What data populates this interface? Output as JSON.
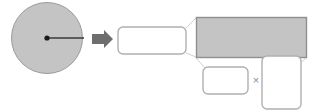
{
  "diagram": {
    "colors": {
      "shape_fill": "#c4c4c4",
      "shape_stroke": "#9a9a9a",
      "box_stroke": "#b0b0b0",
      "box_fill": "#ffffff",
      "arrow_fill": "#6e6e6e",
      "radius_line": "#3a3a3a",
      "center_dot": "#1a1a1a",
      "leader_line": "#cfcfcf",
      "symbol_color": "#8c8c8c",
      "background": "#ffffff"
    },
    "circle": {
      "label": "",
      "center_x": 47,
      "center_y": 38,
      "radius_px": 36,
      "radius_label": "",
      "center_dot_label": ""
    },
    "arrow": {
      "icon": "arrow-right-icon",
      "label": ""
    },
    "answer_boxes": [
      {
        "id": "result-box",
        "label": "",
        "placeholder": ""
      },
      {
        "id": "area-expression-box",
        "label": "",
        "placeholder": ""
      },
      {
        "id": "factor-box-left",
        "label": "",
        "placeholder": ""
      },
      {
        "id": "factor-box-right",
        "label": "",
        "placeholder": ""
      }
    ],
    "operators": [
      {
        "id": "multiply",
        "symbol": "×"
      }
    ]
  }
}
